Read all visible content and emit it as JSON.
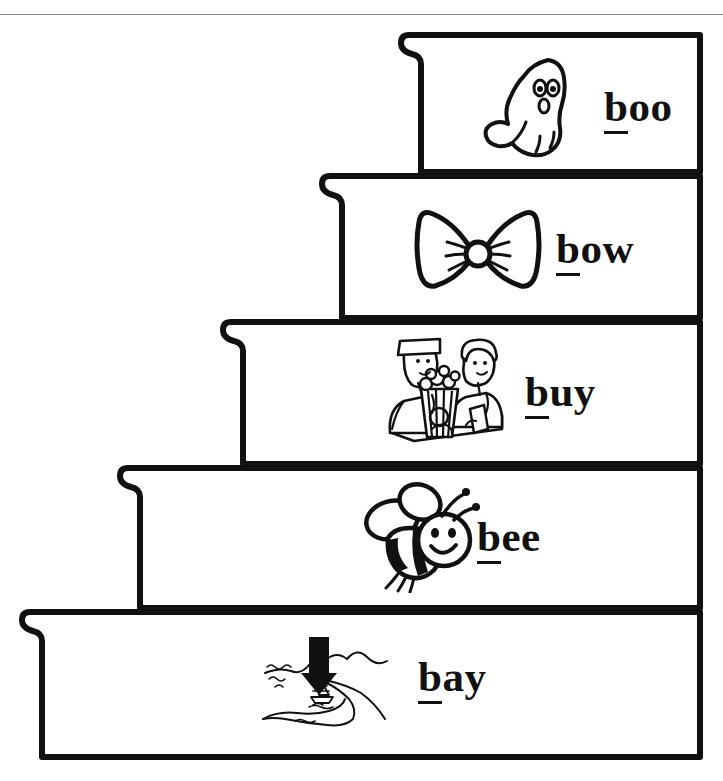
{
  "worksheet": {
    "title": "Word steps worksheet",
    "letter_focus": "b",
    "background_color": "#ffffff",
    "ink_color": "#111111",
    "rule_color": "#8a8a8a",
    "steps": [
      {
        "id": "step-boo",
        "index": 1,
        "word": "boo",
        "first_letter": "b",
        "rest": "oo",
        "picture": "ghost-icon",
        "picture_alt": "ghost",
        "label_x": 604,
        "label_y": 85,
        "pic_x": 478,
        "pic_y": 48,
        "pic_w": 120,
        "pic_h": 120
      },
      {
        "id": "step-bow",
        "index": 2,
        "word": "bow",
        "first_letter": "b",
        "rest": "ow",
        "picture": "bowtie-icon",
        "picture_alt": "bow tie",
        "label_x": 556,
        "label_y": 227,
        "pic_x": 413,
        "pic_y": 200,
        "pic_w": 130,
        "pic_h": 110
      },
      {
        "id": "step-buy",
        "index": 3,
        "word": "buy",
        "first_letter": "b",
        "rest": "uy",
        "picture": "popcorn-vendor-icon",
        "picture_alt": "buying popcorn",
        "label_x": 525,
        "label_y": 370,
        "pic_x": 374,
        "pic_y": 337,
        "pic_w": 135,
        "pic_h": 110
      },
      {
        "id": "step-bee",
        "index": 4,
        "word": "bee",
        "first_letter": "b",
        "rest": "ee",
        "picture": "bee-icon",
        "picture_alt": "bee",
        "label_x": 477,
        "label_y": 515,
        "pic_x": 358,
        "pic_y": 478,
        "pic_w": 125,
        "pic_h": 115
      },
      {
        "id": "step-bay",
        "index": 5,
        "word": "bay",
        "first_letter": "b",
        "rest": "ay",
        "picture": "bay-map-icon",
        "picture_alt": "bay coastline with boat",
        "label_x": 418,
        "label_y": 655,
        "pic_x": 253,
        "pic_y": 633,
        "pic_w": 155,
        "pic_h": 100
      }
    ]
  }
}
